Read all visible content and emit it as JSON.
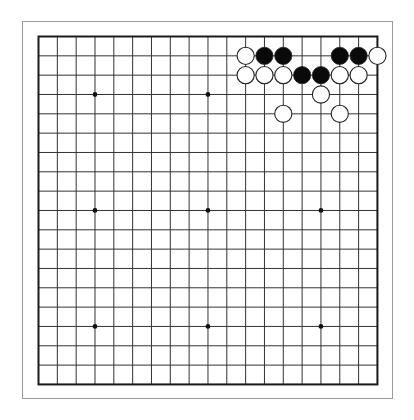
{
  "board": {
    "size": 19,
    "frame": {
      "x": 22.5,
      "y": 21.5,
      "width": 370,
      "height": 377,
      "color": "#9a9a9a"
    },
    "grid": {
      "origin_x": 38.5,
      "origin_y": 36.5,
      "step_x": 18.83,
      "step_y": 19.33,
      "line_color": "#333333",
      "border_color": "#1a1a1a"
    },
    "star_points": [
      [
        4,
        4
      ],
      [
        10,
        4
      ],
      [
        16,
        4
      ],
      [
        4,
        10
      ],
      [
        10,
        10
      ],
      [
        16,
        10
      ],
      [
        4,
        16
      ],
      [
        10,
        16
      ],
      [
        16,
        16
      ]
    ],
    "stone_radius": 8.6,
    "colors": {
      "black": "#0a0a0a",
      "white": "#ffffff",
      "stone_outline": "#222222"
    },
    "stones": [
      {
        "col": 12,
        "row": 2,
        "color": "white"
      },
      {
        "col": 13,
        "row": 2,
        "color": "black"
      },
      {
        "col": 14,
        "row": 2,
        "color": "black"
      },
      {
        "col": 17,
        "row": 2,
        "color": "black"
      },
      {
        "col": 18,
        "row": 2,
        "color": "black"
      },
      {
        "col": 19,
        "row": 2,
        "color": "white"
      },
      {
        "col": 12,
        "row": 3,
        "color": "white"
      },
      {
        "col": 13,
        "row": 3,
        "color": "white"
      },
      {
        "col": 14,
        "row": 3,
        "color": "white"
      },
      {
        "col": 15,
        "row": 3,
        "color": "black"
      },
      {
        "col": 16,
        "row": 3,
        "color": "black"
      },
      {
        "col": 17,
        "row": 3,
        "color": "white"
      },
      {
        "col": 18,
        "row": 3,
        "color": "white"
      },
      {
        "col": 16,
        "row": 4,
        "color": "white"
      },
      {
        "col": 14,
        "row": 5,
        "color": "white"
      },
      {
        "col": 17,
        "row": 5,
        "color": "white"
      }
    ]
  }
}
